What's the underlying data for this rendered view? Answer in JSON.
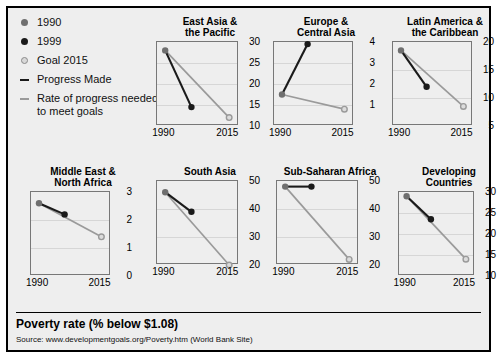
{
  "legend": {
    "items": [
      {
        "label": "1990",
        "marker": "dot-gray-icon"
      },
      {
        "label": "1999",
        "marker": "dot-black-icon"
      },
      {
        "label": "Goal 2015",
        "marker": "dot-open-icon"
      },
      {
        "label": "Progress Made",
        "marker": "dash-black-icon"
      },
      {
        "label": "Rate of progress\nneeded to meet goals",
        "marker": "dash-gray-icon"
      }
    ]
  },
  "footer": {
    "title": "Poverty rate (% below $1.08)",
    "source": "Source:  www.developmentgoals.org/Poverty.htm (World Bank Site)"
  },
  "colors": {
    "y1990": "#6f6f6f",
    "y1999": "#1a1a1a",
    "goal2015": "#b0b0b0",
    "progress_line": "#1a1a1a",
    "needed_line": "#9a9a9a",
    "panel_bg": "#eeeeee",
    "figure_bg": "#eeeeee",
    "grid": "#d6d6d6",
    "frame": "#000000"
  },
  "chart_data": {
    "type": "line",
    "title": "Poverty rate (% below $1.08)",
    "xlabel": "",
    "ylabel": "Poverty rate (% below $1.08)",
    "x": [
      "1990",
      "2015"
    ],
    "x_ticks": [
      "1990",
      "2015"
    ],
    "grid": true,
    "legend_position": "left",
    "series_names": [
      "1990",
      "1999",
      "Goal 2015"
    ],
    "note": "Each panel plots the 1990 value, the 1999 value (Progress Made, black segment) and the 2015 goal (Rate of progress needed to meet goals, gray segment). The 1999 point sits partway along the 1990-2015 horizontal span.",
    "panels": [
      {
        "name": "East Asia & the Pacific",
        "title": "East Asia &\nthe Pacific",
        "ylim": [
          10,
          30
        ],
        "yticks": [
          10,
          15,
          20,
          25,
          30
        ],
        "points": {
          "1990": 28,
          "1999": 14.5,
          "goal_2015": 12
        }
      },
      {
        "name": "Europe & Central Asia",
        "title": "Europe &\nCentral Asia",
        "ylim": [
          0,
          4
        ],
        "yticks": [
          1,
          2,
          3,
          4
        ],
        "points": {
          "1990": 1.5,
          "1999": 3.9,
          "goal_2015": 0.8
        }
      },
      {
        "name": "Latin America & the Caribbean",
        "title": "Latin America &\nthe Caribbean",
        "ylim": [
          5,
          20
        ],
        "yticks": [
          5,
          10,
          15,
          20
        ],
        "points": {
          "1990": 18.5,
          "1999": 12,
          "goal_2015": 8.5
        }
      },
      {
        "name": "Middle East & North Africa",
        "title": "Middle East &\nNorth Africa",
        "ylim": [
          0,
          3
        ],
        "yticks": [
          0,
          1,
          2,
          3
        ],
        "points": {
          "1990": 2.6,
          "1999": 2.2,
          "goal_2015": 1.4
        }
      },
      {
        "name": "South Asia",
        "title": "South Asia",
        "ylim": [
          20,
          50
        ],
        "yticks": [
          20,
          30,
          40,
          50
        ],
        "points": {
          "1990": 46,
          "1999": 39,
          "goal_2015": 20
        }
      },
      {
        "name": "Sub-Saharan Africa",
        "title": "Sub-Saharan Africa",
        "ylim": [
          20,
          50
        ],
        "yticks": [
          20,
          30,
          40,
          50
        ],
        "points": {
          "1990": 48,
          "1999": 48,
          "goal_2015": 22
        }
      },
      {
        "name": "Developing Countries",
        "title": "Developing\nCountries",
        "ylim": [
          10,
          30
        ],
        "yticks": [
          10,
          15,
          20,
          25,
          30
        ],
        "points": {
          "1990": 29,
          "1999": 23.5,
          "goal_2015": 14
        }
      }
    ]
  }
}
